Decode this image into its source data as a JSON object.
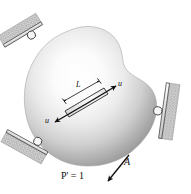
{
  "figure": {
    "type": "mechanics-diagram",
    "background_color": "#ffffff",
    "body_color_highlight": "#fdfdfd",
    "body_color_mid": "#c9c9c9",
    "body_color_edge": "#8e8e8e",
    "ink_color": "#101010",
    "hatch_color": "#9a9a9a"
  },
  "labels": {
    "member_length": "L",
    "force_right": "u",
    "force_left": "u",
    "load": "P' = 1",
    "load_symbol": "P",
    "load_prime": "′",
    "load_value": "= 1",
    "point": "A"
  },
  "supports": [
    {
      "name": "top-left-roller",
      "orientation": "upper-left",
      "kind": "roller"
    },
    {
      "name": "bottom-left-roller",
      "orientation": "lower-left",
      "kind": "roller"
    },
    {
      "name": "right-roller",
      "orientation": "right",
      "kind": "roller"
    }
  ],
  "arrows": [
    {
      "name": "internal-force-right",
      "label": "u",
      "direction": "up-right"
    },
    {
      "name": "internal-force-left",
      "label": "u",
      "direction": "down-left"
    },
    {
      "name": "applied-load",
      "label": "P' = 1",
      "direction": "down-left"
    }
  ]
}
